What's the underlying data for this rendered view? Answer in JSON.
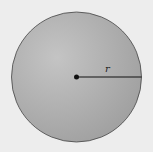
{
  "diagram": {
    "shape": "circle",
    "radius_label": "r",
    "colors": {
      "background": "#ededed",
      "fill_light": "#bdbdbd",
      "fill_dark": "#9a9a9a",
      "stroke": "#444444",
      "line": "#111111"
    }
  }
}
